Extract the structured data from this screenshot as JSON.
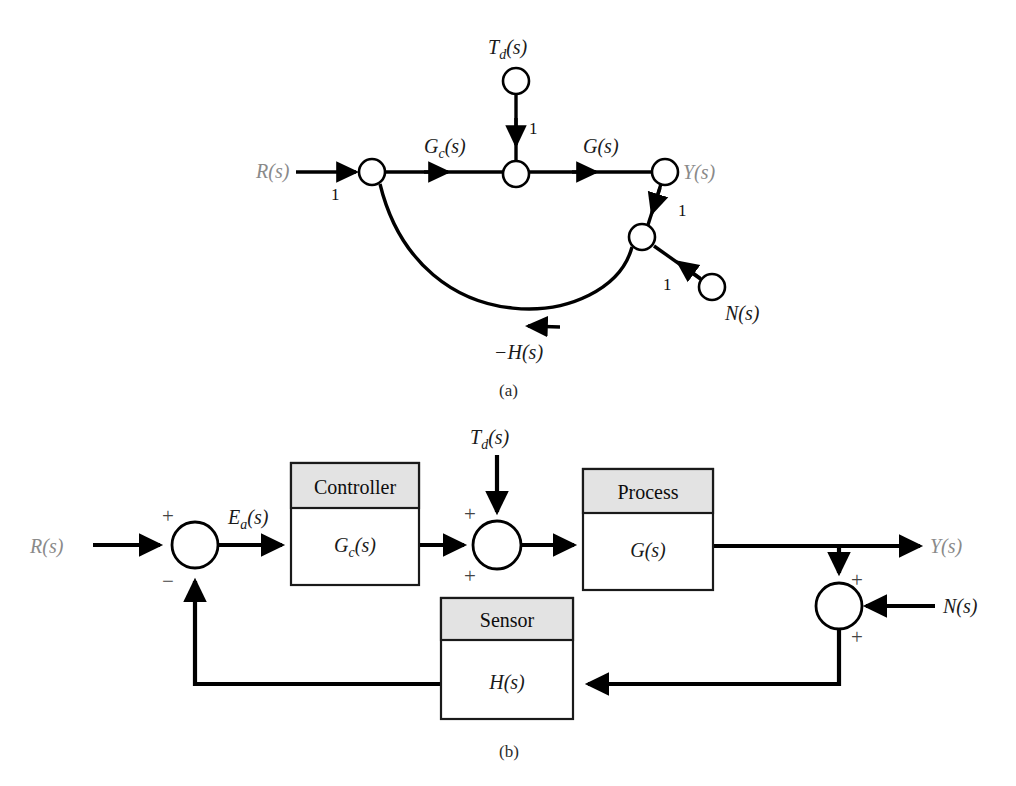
{
  "figure": {
    "caption_a": "(a)",
    "caption_b": "(b)",
    "background": "#ffffff",
    "signal_color": "#000000",
    "signal_label_color": "#8a8a8a",
    "block_header_fill": "#e3e3e3"
  },
  "signal_flow_graph": {
    "title_label": "(a)",
    "nodes": [
      {
        "id": "R",
        "label": "R(s)",
        "x": 372,
        "y": 172,
        "label_x": 288,
        "label_y": 178
      },
      {
        "id": "Td",
        "label": "T",
        "label_sub": "d",
        "label_tail": "(s)",
        "x": 516,
        "y": 81
      },
      {
        "id": "sum",
        "label": "",
        "x": 516,
        "y": 174
      },
      {
        "id": "Y",
        "label": "Y(s)",
        "x": 665,
        "y": 172,
        "label_x": 684,
        "label_y": 178
      },
      {
        "id": "mix",
        "label": "",
        "x": 642,
        "y": 237
      },
      {
        "id": "N",
        "label": "N(s)",
        "x": 712,
        "y": 287,
        "label_x": 728,
        "label_y": 315
      }
    ],
    "edges": [
      {
        "from": "R-input",
        "to": "R",
        "gain": "1",
        "gain_x": 334,
        "gain_y": 198
      },
      {
        "from": "R",
        "to": "sum",
        "gain": "G_c(s)",
        "gain_x": 446,
        "gain_y": 152
      },
      {
        "from": "Td",
        "to": "sum",
        "gain": "1",
        "gain_x": 531,
        "gain_y": 131
      },
      {
        "from": "sum",
        "to": "Y",
        "gain": "G(s)",
        "gain_x": 604,
        "gain_y": 152
      },
      {
        "from": "Y",
        "to": "mix",
        "gain": "1",
        "gain_x": 680,
        "gain_y": 213
      },
      {
        "from": "N",
        "to": "mix",
        "gain": "1",
        "gain_x": 667,
        "gain_y": 285
      },
      {
        "from": "mix",
        "to": "R",
        "gain": "-H(s)",
        "gain_x": 523,
        "gain_y": 355
      }
    ],
    "gain_labels": {
      "input_gain": "1",
      "controller_gain_main": "G",
      "controller_gain_sub": "c",
      "controller_gain_tail": "(s)",
      "disturbance_gain": "1",
      "process_gain": "G(s)",
      "output_gain": "1",
      "noise_gain": "1",
      "feedback_gain_prefix": "−",
      "feedback_gain": "H(s)"
    },
    "node_labels": {
      "input": "R(s)",
      "disturbance_main": "T",
      "disturbance_sub": "d",
      "disturbance_tail": "(s)",
      "output": "Y(s)",
      "noise": "N(s)"
    }
  },
  "block_diagram": {
    "title_label": "(b)",
    "inputs": {
      "reference": "R(s)",
      "disturbance_main": "T",
      "disturbance_sub": "d",
      "disturbance_tail": "(s)",
      "noise": "N(s)"
    },
    "outputs": {
      "result": "Y(s)"
    },
    "signals": {
      "error_main": "E",
      "error_sub": "a",
      "error_tail": "(s)"
    },
    "blocks": [
      {
        "id": "controller",
        "header": "Controller",
        "body_main": "G",
        "body_sub": "c",
        "body_tail": "(s)",
        "x": 291,
        "y": 463,
        "w": 128,
        "h": 122,
        "header_h": 45
      },
      {
        "id": "process",
        "header": "Process",
        "body_main": "G",
        "body_sub": "",
        "body_tail": "(s)",
        "x": 583,
        "y": 469,
        "w": 130,
        "h": 121,
        "header_h": 44
      },
      {
        "id": "sensor",
        "header": "Sensor",
        "body_main": "H",
        "body_sub": "",
        "body_tail": "(s)",
        "x": 441,
        "y": 598,
        "w": 132,
        "h": 121,
        "header_h": 42
      }
    ],
    "summing_junctions": [
      {
        "id": "error-junction",
        "cx": 195,
        "cy": 545,
        "r": 23,
        "signs": [
          {
            "text": "+",
            "x": 168,
            "y": 516
          },
          {
            "text": "−",
            "x": 168,
            "y": 580
          }
        ]
      },
      {
        "id": "disturbance-junction",
        "cx": 497,
        "cy": 545,
        "r": 24,
        "signs": [
          {
            "text": "+",
            "x": 467,
            "y": 515
          },
          {
            "text": "+",
            "x": 467,
            "y": 578
          }
        ]
      },
      {
        "id": "noise-junction",
        "cx": 839,
        "cy": 606,
        "r": 23,
        "signs": [
          {
            "text": "+",
            "x": 856,
            "y": 581
          },
          {
            "text": "+",
            "x": 856,
            "y": 637
          }
        ]
      }
    ]
  }
}
